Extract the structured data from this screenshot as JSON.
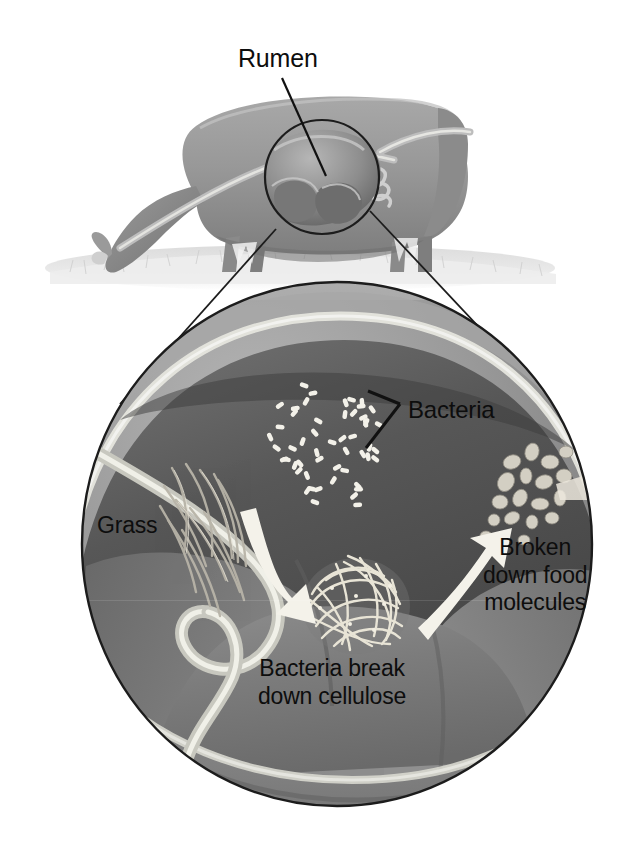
{
  "figure": {
    "background_color": "#ffffff",
    "ink_color": "#0d0d0d",
    "labels": {
      "rumen": "Rumen",
      "bacteria": "Bacteria",
      "grass": "Grass",
      "broken_down_food_molecules": "Broken\ndown food\nmolecules",
      "bacteria_break_down_cellulose": "Bacteria break\ndown cellulose"
    },
    "scene": {
      "cow": {
        "description": "grayscale illustration of a grazing cow seen from the side, head lowered to grass",
        "body_color": "#9a9a9a",
        "ground_color": "#d8d8d8"
      },
      "callout_circle_small": {
        "description": "thin black circle outlining the rumen on the cow's body",
        "cx": 322,
        "cy": 177,
        "r": 57,
        "stroke": "#1a1a1a"
      },
      "callout_circle_large": {
        "description": "magnified cutaway view of the rumen interior",
        "cx": 337,
        "cy": 544,
        "rx": 255,
        "ry": 262,
        "stroke": "#1a1a1a",
        "fill_color": "#8f8f8f"
      },
      "magnification_lines": [
        {
          "from": [
            278,
            232
          ],
          "to": [
            120,
            400
          ]
        },
        {
          "from": [
            372,
            213
          ],
          "to": [
            549,
            400
          ]
        }
      ],
      "leader_lines": [
        {
          "name": "rumen-leader",
          "from": [
            284,
            78
          ],
          "to": [
            325,
            175
          ]
        },
        {
          "name": "bacteria-leader-upper",
          "from": [
            399,
            404
          ],
          "to": [
            372,
            392
          ]
        },
        {
          "name": "bacteria-leader-lower",
          "from": [
            399,
            412
          ],
          "to": [
            369,
            448
          ]
        }
      ],
      "elements": [
        {
          "name": "bacteria-cluster",
          "type": "rod-shaped specks",
          "count": 72,
          "color": "#f2f0ea",
          "cx": 328,
          "cy": 447
        },
        {
          "name": "grass-strands",
          "type": "cellulose fibers",
          "color": "#b9b5aa",
          "cx": 187,
          "cy": 510
        },
        {
          "name": "cellulose-ball",
          "type": "tangled fiber mass",
          "color": "#e6e2d6",
          "cx": 356,
          "cy": 602
        },
        {
          "name": "food-molecules",
          "type": "small ovoid blobs",
          "color": "#cfcbc0",
          "cx": 530,
          "cy": 489
        },
        {
          "name": "arrow-to-cellulose",
          "type": "curved white arrow",
          "direction": "down-right"
        },
        {
          "name": "arrow-to-molecules",
          "type": "curved white arrow",
          "direction": "up-right"
        }
      ]
    }
  }
}
